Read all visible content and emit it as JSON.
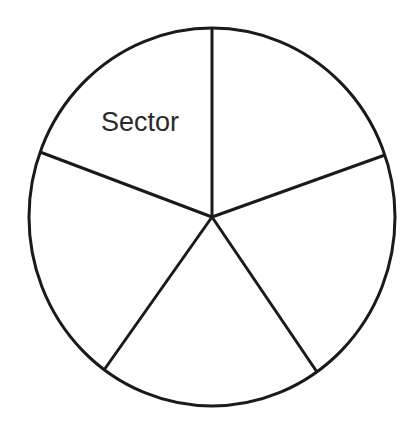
{
  "figure": {
    "background_color": "#ffffff",
    "stroke_color": "#1a1a1a",
    "stroke_width": 3,
    "label_color": "#2b2b2b",
    "label_font_size": 27
  },
  "labels": {
    "sector": "Sector"
  },
  "chart_data": {
    "type": "pie",
    "title": "",
    "subtitle": "",
    "xlabel": "",
    "ylabel": "",
    "grid": false,
    "legend": "none",
    "annotations": [
      {
        "text": "Sector",
        "x": 140,
        "y": 131,
        "describes": "upper-left-sector"
      }
    ],
    "geometry": {
      "center_x": 212,
      "center_y": 217,
      "radius_x": 183,
      "radius_y": 189,
      "units": "px"
    },
    "categories": [
      "Sector 1 (top-left)",
      "Sector 2 (top-right)",
      "Sector 3 (bottom-right)",
      "Sector 4 (bottom)",
      "Sector 5 (left)"
    ],
    "values": [
      70,
      71,
      75,
      71,
      73
    ],
    "boundary_angles_deg": [
      90,
      19,
      305,
      234,
      160
    ],
    "slices": [
      {
        "name": "Sector 1 (top-left)",
        "label": "Sector",
        "start_angle_deg": 90,
        "end_angle_deg": 160,
        "sweep_deg": 70,
        "fill": "#ffffff"
      },
      {
        "name": "Sector 2 (top-right)",
        "label": "",
        "start_angle_deg": 19,
        "end_angle_deg": 90,
        "sweep_deg": 71,
        "fill": "#ffffff"
      },
      {
        "name": "Sector 3 (bottom-right)",
        "label": "",
        "start_angle_deg": 305,
        "end_angle_deg": 379,
        "sweep_deg": 74,
        "fill": "#ffffff"
      },
      {
        "name": "Sector 4 (bottom)",
        "label": "",
        "start_angle_deg": 234,
        "end_angle_deg": 305,
        "sweep_deg": 71,
        "fill": "#ffffff"
      },
      {
        "name": "Sector 5 (left)",
        "label": "",
        "start_angle_deg": 160,
        "end_angle_deg": 234,
        "sweep_deg": 74,
        "fill": "#ffffff"
      }
    ],
    "radii": [
      {
        "name": "radius-top",
        "angle_deg": 90,
        "end_x": 212,
        "end_y": 28
      },
      {
        "name": "radius-upper-right",
        "angle_deg": 19,
        "end_x": 385,
        "end_y": 155
      },
      {
        "name": "radius-lower-right",
        "angle_deg": 305,
        "end_x": 317,
        "end_y": 372
      },
      {
        "name": "radius-lower-left",
        "angle_deg": 234,
        "end_x": 104,
        "end_y": 370
      },
      {
        "name": "radius-upper-left",
        "angle_deg": 160,
        "end_x": 40,
        "end_y": 152
      }
    ]
  }
}
